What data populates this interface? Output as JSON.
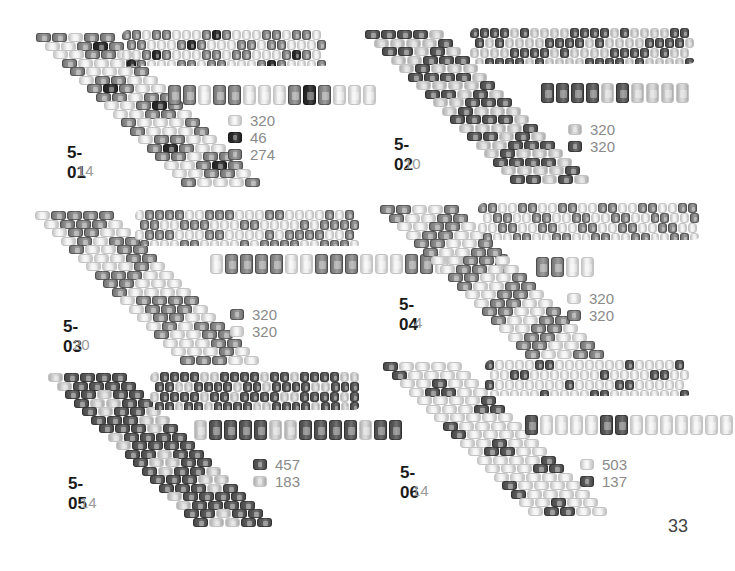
{
  "page_number": "33",
  "colors": {
    "white": "#f2f2f2",
    "light": "#d6d6d6",
    "mid": "#8e8e8e",
    "dark": "#5a5a5a",
    "black": "#2a2a2a"
  },
  "patterns": [
    {
      "id": "5-01",
      "repeat": "14",
      "sequence": [
        "mid",
        "mid",
        "white",
        "mid",
        "mid",
        "white",
        "white",
        "white",
        "mid",
        "black",
        "mid",
        "white",
        "white",
        "white"
      ],
      "legend": [
        {
          "color": "white",
          "count": "320"
        },
        {
          "color": "black",
          "count": "46"
        },
        {
          "color": "mid",
          "count": "274"
        }
      ]
    },
    {
      "id": "5-02",
      "repeat": "10",
      "sequence": [
        "dark",
        "dark",
        "dark",
        "dark",
        "light",
        "dark",
        "light",
        "light",
        "light",
        "light"
      ],
      "legend": [
        {
          "color": "light",
          "count": "320"
        },
        {
          "color": "dark",
          "count": "320"
        }
      ]
    },
    {
      "id": "5-03",
      "repeat": "20",
      "sequence": [
        "white",
        "mid",
        "mid",
        "mid",
        "mid",
        "white",
        "white",
        "mid",
        "mid",
        "mid",
        "white",
        "white",
        "white",
        "mid",
        "mid",
        "white",
        "white",
        "white",
        "white",
        "mid"
      ],
      "legend": [
        {
          "color": "mid",
          "count": "320"
        },
        {
          "color": "white",
          "count": "320"
        }
      ]
    },
    {
      "id": "5-04",
      "repeat": "4",
      "sequence": [
        "mid",
        "mid",
        "white",
        "white"
      ],
      "legend": [
        {
          "color": "white",
          "count": "320"
        },
        {
          "color": "mid",
          "count": "320"
        }
      ]
    },
    {
      "id": "5-05",
      "repeat": "14",
      "sequence": [
        "light",
        "dark",
        "dark",
        "dark",
        "dark",
        "light",
        "light",
        "dark",
        "dark",
        "dark",
        "dark",
        "light",
        "dark",
        "dark"
      ],
      "legend": [
        {
          "color": "dark",
          "count": "457"
        },
        {
          "color": "light",
          "count": "183"
        }
      ]
    },
    {
      "id": "5-06",
      "repeat": "14",
      "sequence": [
        "dark",
        "white",
        "white",
        "white",
        "white",
        "dark",
        "dark",
        "white",
        "white",
        "white",
        "white",
        "white",
        "white",
        "white"
      ],
      "legend": [
        {
          "color": "white",
          "count": "503"
        },
        {
          "color": "dark",
          "count": "137"
        }
      ]
    }
  ]
}
